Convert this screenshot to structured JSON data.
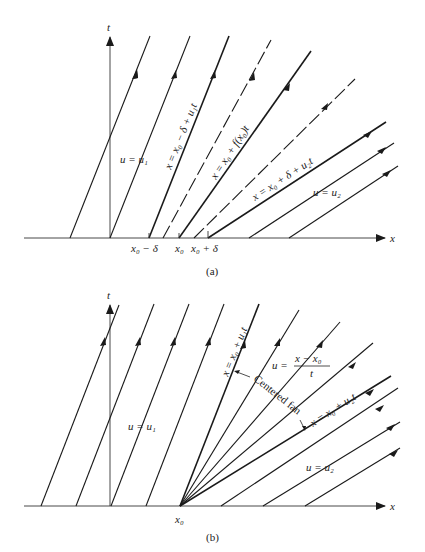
{
  "panel_a": {
    "caption": "(a)",
    "axis_x_label": "x",
    "axis_t_label": "t",
    "tick_labels": [
      "x₀ − δ",
      "x₀",
      "x₀ + δ"
    ],
    "labels": {
      "u1": "u = u₁",
      "left_boundary": "x = x₀ − δ + u₁t",
      "middle": "x = x₀ + f(x₀)t",
      "right_boundary": "x = x₀ + δ + u₂t",
      "u2": "u = u₂"
    }
  },
  "panel_b": {
    "caption": "(b)",
    "axis_x_label": "x",
    "axis_t_label": "t",
    "tick_labels": [
      "x₀"
    ],
    "labels": {
      "u1": "u = u₁",
      "left_boundary": "x = x₀ + u₁t",
      "fan_solution_lhs": "u =",
      "fan_solution_num": "x − x₀",
      "fan_solution_den": "t",
      "fan_name": "Centered fan",
      "right_boundary": "x = x₀ + u₂t",
      "u2": "u = u₂"
    }
  },
  "colors": {
    "ink": "#1a1a1a",
    "background": "#ffffff"
  }
}
